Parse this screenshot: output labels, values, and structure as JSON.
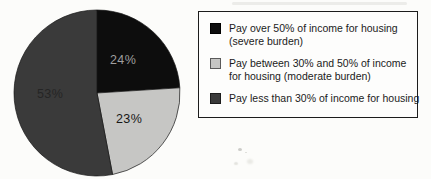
{
  "chart_data": {
    "type": "pie",
    "title": "",
    "start_angle_deg": 0,
    "direction": "clockwise",
    "legend_position": "right",
    "slices": [
      {
        "name": "Pay over 50% of income for housing (severe burden)",
        "value": 24,
        "display": "24%",
        "color": "#0d0d0d",
        "label_color": "#9f9f9f"
      },
      {
        "name": "Pay between 30% and 50% of income for housing (moderate burden)",
        "value": 23,
        "display": "23%",
        "color": "#c6c6c4",
        "label_color": "#161616"
      },
      {
        "name": "Pay less than 30% of income for housing",
        "value": 53,
        "display": "53%",
        "color": "#3a3a3a",
        "label_color": "#252525"
      }
    ]
  },
  "legend": {
    "border_color": "#1c1c1c",
    "items": [
      {
        "lines": [
          "Pay over 50% of income for housing",
          "(severe burden)"
        ],
        "swatch_color": "#0d0d0d",
        "swatch_border": "#000000"
      },
      {
        "lines": [
          "Pay between 30% and 50% of income",
          "for housing (moderate burden)"
        ],
        "swatch_color": "#c6c6c4",
        "swatch_border": "#5a5a5a"
      },
      {
        "lines": [
          "Pay less than 30% of income for housing"
        ],
        "swatch_color": "#3a3a3a",
        "swatch_border": "#1c1c1c"
      }
    ]
  }
}
